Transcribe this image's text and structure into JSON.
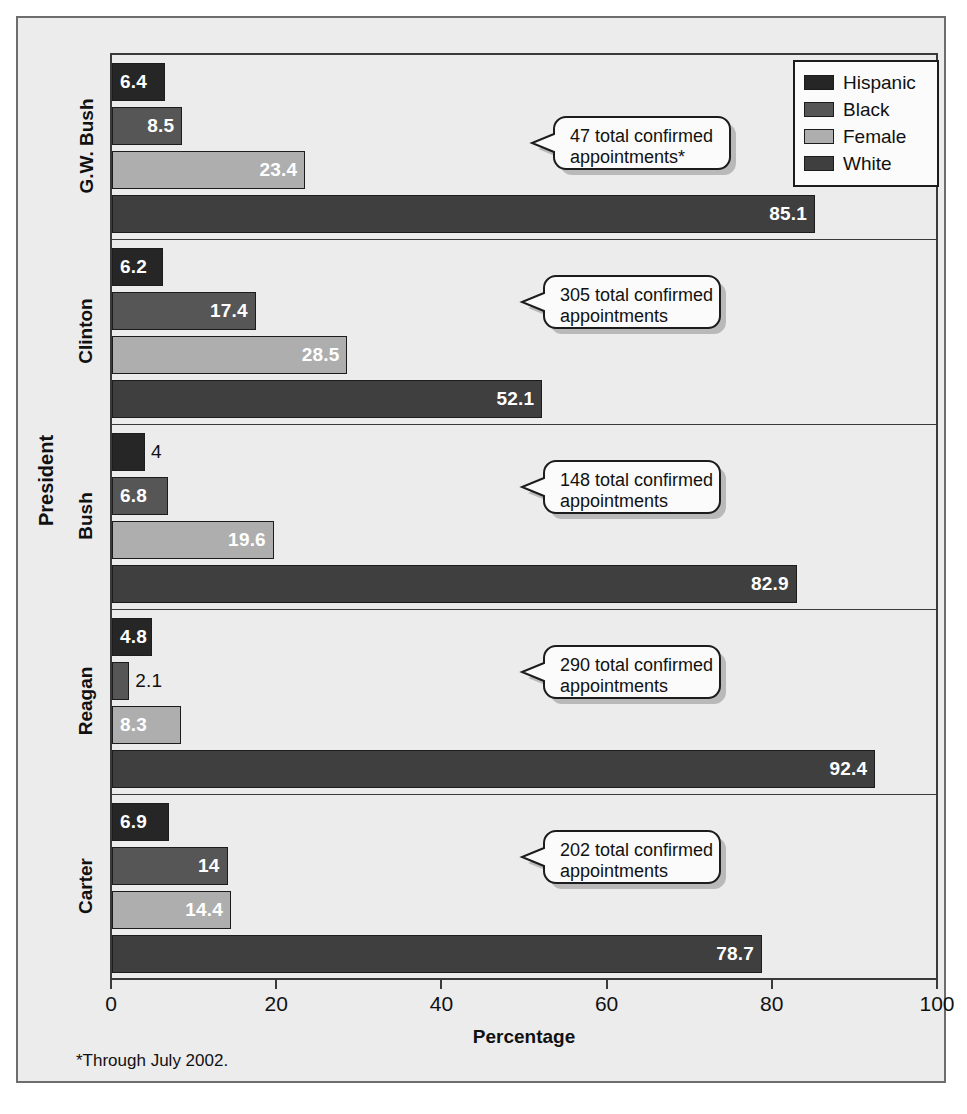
{
  "chart_data": {
    "type": "bar",
    "orientation": "horizontal",
    "title": "",
    "xlabel": "Percentage",
    "ylabel": "President",
    "xlim": [
      0,
      100
    ],
    "xticks": [
      "0",
      "20",
      "40",
      "60",
      "80",
      "100"
    ],
    "grid": false,
    "legend_position": "top-right",
    "categories": [
      "G.W. Bush",
      "Clinton",
      "Bush",
      "Reagan",
      "Carter"
    ],
    "series": [
      {
        "name": "Hispanic",
        "color": "#262626",
        "values": [
          6.4,
          6.2,
          4,
          4.8,
          6.9
        ],
        "labels": [
          "6.4",
          "6.2",
          "4",
          "4.8",
          "6.9"
        ]
      },
      {
        "name": "Black",
        "color": "#565656",
        "values": [
          8.5,
          17.4,
          6.8,
          2.1,
          14
        ],
        "labels": [
          "8.5",
          "17.4",
          "6.8",
          "2.1",
          "14"
        ]
      },
      {
        "name": "Female",
        "color": "#aeaeae",
        "values": [
          23.4,
          28.5,
          19.6,
          8.3,
          14.4
        ],
        "labels": [
          "23.4",
          "28.5",
          "19.6",
          "8.3",
          "14.4"
        ]
      },
      {
        "name": "White",
        "color": "#3f3f3f",
        "values": [
          85.1,
          52.1,
          82.9,
          92.4,
          78.7
        ],
        "labels": [
          "85.1",
          "52.1",
          "82.9",
          "92.4",
          "78.7"
        ]
      }
    ],
    "annotations": [
      {
        "category": "G.W. Bush",
        "text": "47 total confirmed appointments*"
      },
      {
        "category": "Clinton",
        "text": "305 total confirmed appointments"
      },
      {
        "category": "Bush",
        "text": "148 total confirmed appointments"
      },
      {
        "category": "Reagan",
        "text": "290 total confirmed appointments"
      },
      {
        "category": "Carter",
        "text": "202 total confirmed appointments"
      }
    ],
    "footnote": "*Through July 2002."
  },
  "axes": {
    "x_title": "Percentage",
    "y_title": "President",
    "ticks": [
      {
        "label": "0"
      },
      {
        "label": "20"
      },
      {
        "label": "40"
      },
      {
        "label": "60"
      },
      {
        "label": "80"
      },
      {
        "label": "100"
      }
    ]
  },
  "legend": {
    "items": [
      {
        "label": "Hispanic"
      },
      {
        "label": "Black"
      },
      {
        "label": "Female"
      },
      {
        "label": "White"
      }
    ]
  },
  "groups": [
    {
      "category": "G.W. Bush",
      "callout": "47 total confirmed appointments*",
      "bars": [
        {
          "series": "Hispanic",
          "value": 6.4,
          "label": "6.4"
        },
        {
          "series": "Black",
          "value": 8.5,
          "label": "8.5"
        },
        {
          "series": "Female",
          "value": 23.4,
          "label": "23.4"
        },
        {
          "series": "White",
          "value": 85.1,
          "label": "85.1"
        }
      ]
    },
    {
      "category": "Clinton",
      "callout": "305 total confirmed appointments",
      "bars": [
        {
          "series": "Hispanic",
          "value": 6.2,
          "label": "6.2"
        },
        {
          "series": "Black",
          "value": 17.4,
          "label": "17.4"
        },
        {
          "series": "Female",
          "value": 28.5,
          "label": "28.5"
        },
        {
          "series": "White",
          "value": 52.1,
          "label": "52.1"
        }
      ]
    },
    {
      "category": "Bush",
      "callout": "148 total confirmed appointments",
      "bars": [
        {
          "series": "Hispanic",
          "value": 4,
          "label": "4"
        },
        {
          "series": "Black",
          "value": 6.8,
          "label": "6.8"
        },
        {
          "series": "Female",
          "value": 19.6,
          "label": "19.6"
        },
        {
          "series": "White",
          "value": 82.9,
          "label": "82.9"
        }
      ]
    },
    {
      "category": "Reagan",
      "callout": "290 total confirmed appointments",
      "bars": [
        {
          "series": "Hispanic",
          "value": 4.8,
          "label": "4.8"
        },
        {
          "series": "Black",
          "value": 2.1,
          "label": "2.1"
        },
        {
          "series": "Female",
          "value": 8.3,
          "label": "8.3"
        },
        {
          "series": "White",
          "value": 92.4,
          "label": "92.4"
        }
      ]
    },
    {
      "category": "Carter",
      "callout": "202 total confirmed appointments",
      "bars": [
        {
          "series": "Hispanic",
          "value": 6.9,
          "label": "6.9"
        },
        {
          "series": "Black",
          "value": 14,
          "label": "14"
        },
        {
          "series": "Female",
          "value": 14.4,
          "label": "14.4"
        },
        {
          "series": "White",
          "value": 78.7,
          "label": "78.7"
        }
      ]
    }
  ],
  "footnote": "*Through July 2002.",
  "colors": {
    "hispanic": "#262626",
    "black": "#565656",
    "female": "#aeaeae",
    "white": "#3f3f3f",
    "frame": "#6d6d6d",
    "axis": "#3a3a3a",
    "background": "#ececed"
  }
}
